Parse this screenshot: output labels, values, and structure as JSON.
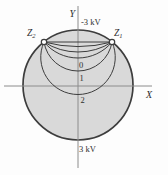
{
  "figure": {
    "type": "equipotential-field-diagram",
    "labels": {
      "y_axis": "Y",
      "x_axis": "X",
      "top_potential": "-3 kV",
      "bottom_potential": "3 kV",
      "point_left": {
        "main": "Z",
        "sub": "2"
      },
      "point_right": {
        "main": "Z",
        "sub": "1"
      }
    },
    "colors": {
      "region_fill": "#d9d9d9",
      "curve_stroke": "#3d3d3d",
      "axis_stroke": "#8c8c8c",
      "marker_fill": "#ffffff",
      "background": "#fdfdfd"
    },
    "boundary_circle": {
      "potential_top_arc": "-3 kV",
      "potential_bottom_arc": "3 kV"
    },
    "equipotential_arcs": [
      {
        "sag": 0,
        "label": ""
      },
      {
        "sag": 4.5,
        "label": ""
      },
      {
        "sag": 10,
        "label": ""
      },
      {
        "sag": 16,
        "label": "0"
      },
      {
        "sag": 29,
        "label": "1"
      },
      {
        "sag": 52.5,
        "label": "2"
      }
    ],
    "arc_label_positions": [
      {
        "x": 79,
        "y": 68
      },
      {
        "x": 79.5,
        "y": 81
      },
      {
        "x": 80.5,
        "y": 103
      }
    ]
  }
}
